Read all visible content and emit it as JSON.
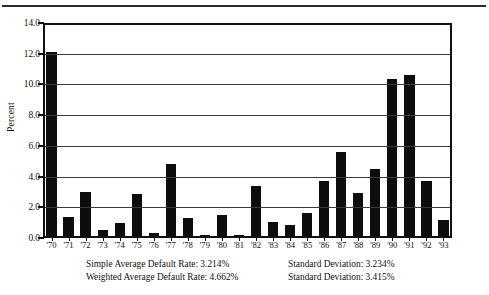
{
  "figure": {
    "top_rule_fragment": "",
    "y_axis_title": "Percent"
  },
  "chart_data": {
    "type": "bar",
    "title": "",
    "xlabel": "",
    "ylabel": "Percent",
    "ylim": [
      0.0,
      14.0
    ],
    "yticks": [
      "0.0",
      "2.0",
      "4.0",
      "6.0",
      "8.0",
      "10.0",
      "12.0",
      "14.0"
    ],
    "ytick_values": [
      0.0,
      2.0,
      4.0,
      6.0,
      8.0,
      10.0,
      12.0,
      14.0
    ],
    "grid": "horizontal",
    "legend": "none",
    "categories": [
      "'70",
      "'71",
      "'72",
      "'73",
      "'74",
      "'75",
      "'76",
      "'77",
      "'78",
      "'79",
      "'80",
      "'81",
      "'82",
      "'83",
      "'84",
      "'85",
      "'86",
      "'87",
      "'88",
      "'89",
      "'90",
      "'91",
      "'92",
      "'93"
    ],
    "values": [
      12.1,
      1.4,
      3.0,
      0.55,
      1.0,
      2.85,
      0.3,
      4.8,
      1.3,
      0.1,
      1.5,
      0.15,
      3.4,
      1.05,
      0.85,
      1.6,
      3.7,
      5.6,
      2.9,
      4.5,
      10.35,
      10.6,
      3.7,
      1.2
    ],
    "bar_color": "#0d0d0d"
  },
  "stats": {
    "rows": [
      {
        "left": "Simple Average Default Rate: 3.214%",
        "right": "Standard Deviation: 3.234%"
      },
      {
        "left": "Weighted Average Default Rate: 4.662%",
        "right": "Standard Deviation: 3.415%"
      }
    ]
  }
}
